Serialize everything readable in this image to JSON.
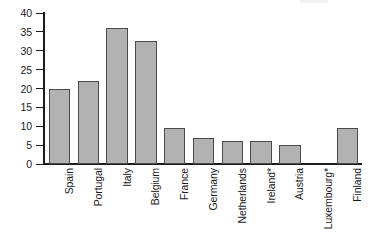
{
  "chart_data": {
    "type": "bar",
    "title": "",
    "subtitle": "",
    "xlabel": "",
    "ylabel": "",
    "ylim": [
      0,
      40
    ],
    "yticks": [
      0,
      5,
      10,
      15,
      20,
      25,
      30,
      35,
      40
    ],
    "ytick_labels": [
      "0",
      "5",
      "10",
      "15",
      "20",
      "25",
      "30",
      "35",
      "40"
    ],
    "grid": false,
    "legend": null,
    "bar_color": "#b2b2b2",
    "bar_edge_color": "#4a4a4a",
    "axis_color": "#1c1c1c",
    "categories": [
      "Spain",
      "Portugal",
      "Italy",
      "Belgium",
      "France",
      "Germany",
      "Netherlands",
      "Ireland*",
      "Austria",
      "Luxembourg*",
      "Finland"
    ],
    "values": [
      20,
      22,
      36,
      32.5,
      9.5,
      7,
      6,
      6,
      5,
      0,
      9.5
    ]
  }
}
